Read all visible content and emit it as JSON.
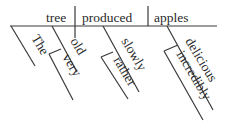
{
  "diagram": {
    "type": "reed-kellogg-sentence-diagram",
    "sentence_words": [
      "The",
      "very",
      "old",
      "tree",
      "rather",
      "slowly",
      "produced",
      "incredibly",
      "delicious",
      "apples"
    ],
    "main_line": {
      "subject": "tree",
      "verb": "produced",
      "object": "apples"
    },
    "modifiers": {
      "article": "The",
      "adjective_subject": "old",
      "adverb_of_old": "very",
      "adverb_verb": "slowly",
      "adverb_of_slowly": "rather",
      "adjective_object": "delicious",
      "adverb_of_delicious": "incredibly"
    }
  }
}
